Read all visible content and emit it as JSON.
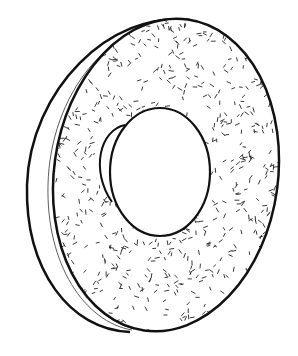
{
  "figure": {
    "caption": "",
    "colors": {
      "stroke": "#111111",
      "fill": "#ffffff",
      "speckle": "#222222"
    }
  }
}
